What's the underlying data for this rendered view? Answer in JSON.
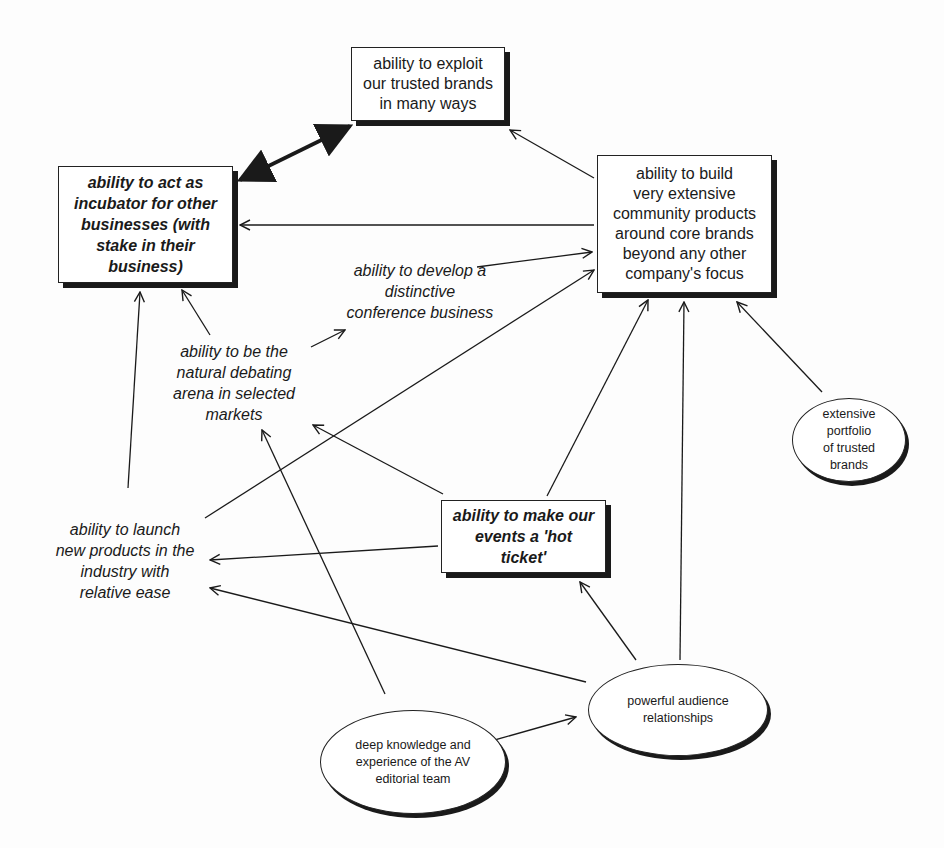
{
  "diagram": {
    "type": "strategy-map",
    "nodes": [
      {
        "id": "exploit",
        "style": "box",
        "label": "ability to exploit\nour trusted brands\nin many ways"
      },
      {
        "id": "incubator",
        "style": "box-bold-italic",
        "label": "ability to act as\nincubator for other\nbusinesses (with\nstake in their\nbusiness)"
      },
      {
        "id": "community",
        "style": "box",
        "label": "ability to build\nvery extensive\ncommunity products\naround core brands\nbeyond any other\ncompany's focus"
      },
      {
        "id": "conference",
        "style": "italic-text",
        "label": "ability to develop a\ndistinctive\nconference business"
      },
      {
        "id": "debating",
        "style": "italic-text",
        "label": "ability to be the\nnatural debating\narena in selected\nmarkets"
      },
      {
        "id": "launch",
        "style": "italic-text",
        "label": "ability to launch\nnew products in the\nindustry with\nrelative ease"
      },
      {
        "id": "hot_ticket",
        "style": "box-bold-italic",
        "label": "ability to make our\nevents a  'hot\nticket'"
      },
      {
        "id": "portfolio",
        "style": "ellipse",
        "label": "extensive portfolio\nof trusted brands"
      },
      {
        "id": "audience",
        "style": "ellipse",
        "label": "powerful audience\nrelationships"
      },
      {
        "id": "knowledge",
        "style": "ellipse",
        "label": "deep knowledge and\nexperience of the AV\neditorial team"
      }
    ],
    "edges": [
      {
        "from": "incubator",
        "to": "exploit",
        "type": "bidirectional-bold"
      },
      {
        "from": "community",
        "to": "exploit"
      },
      {
        "from": "community",
        "to": "incubator"
      },
      {
        "from": "conference",
        "to": "community"
      },
      {
        "from": "debating",
        "to": "incubator"
      },
      {
        "from": "debating",
        "to": "conference"
      },
      {
        "from": "launch",
        "to": "incubator"
      },
      {
        "from": "launch",
        "to": "community"
      },
      {
        "from": "hot_ticket",
        "to": "debating"
      },
      {
        "from": "hot_ticket",
        "to": "community"
      },
      {
        "from": "hot_ticket",
        "to": "launch"
      },
      {
        "from": "portfolio",
        "to": "community"
      },
      {
        "from": "audience",
        "to": "community"
      },
      {
        "from": "audience",
        "to": "hot_ticket"
      },
      {
        "from": "audience",
        "to": "launch"
      },
      {
        "from": "knowledge",
        "to": "debating"
      },
      {
        "from": "knowledge",
        "to": "audience"
      }
    ]
  },
  "colors": {
    "ink": "#1a1a1a",
    "background": "#fdfdfd"
  }
}
